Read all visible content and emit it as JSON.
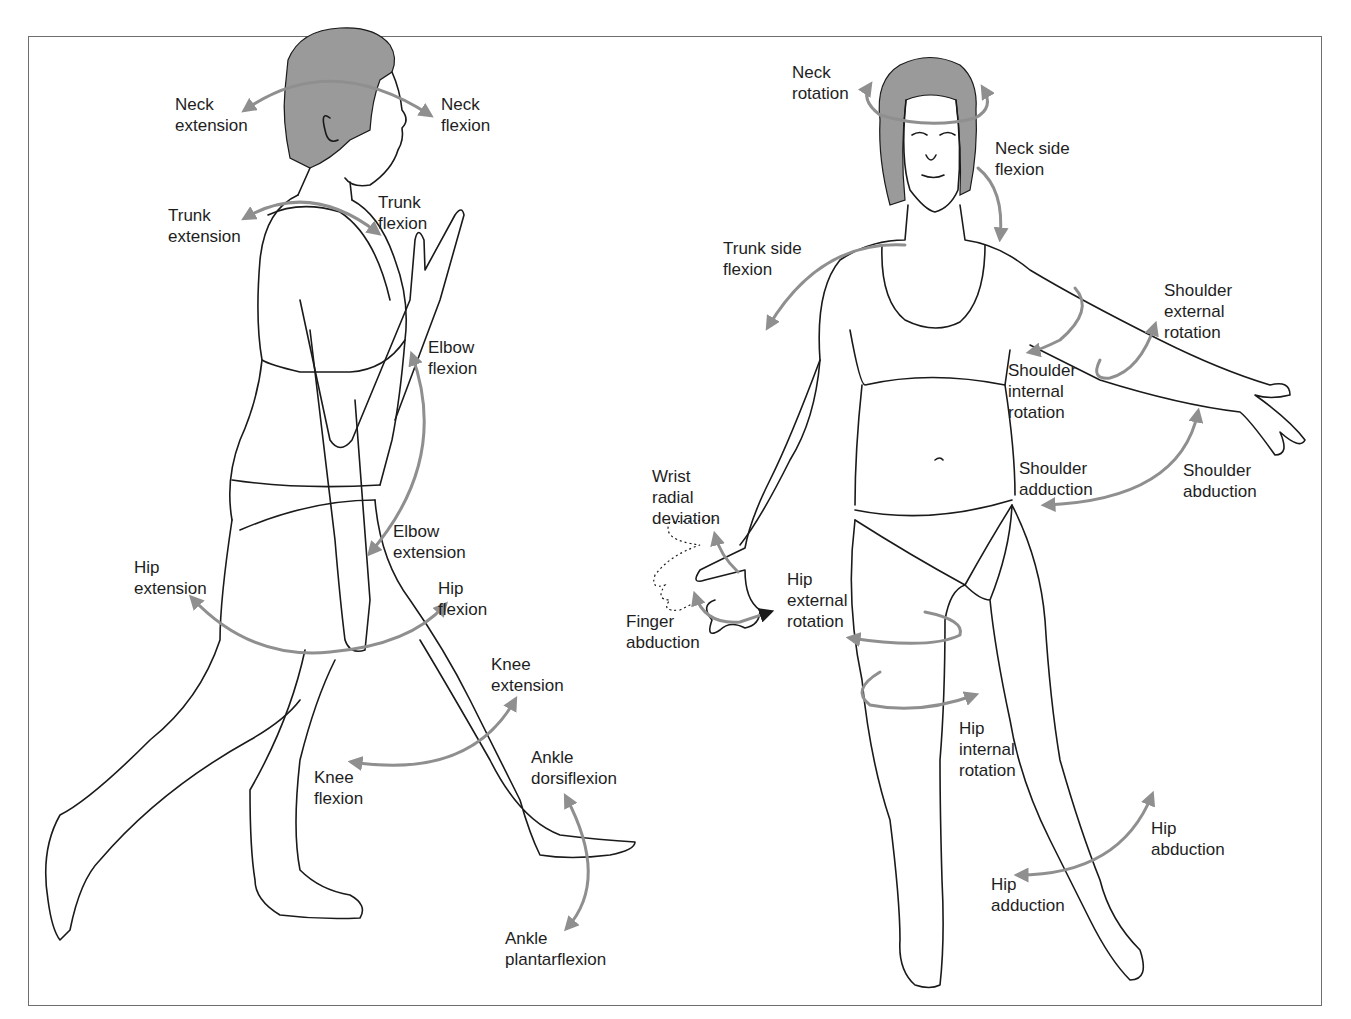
{
  "figure": {
    "arrow_color": "#8f8f8f",
    "line_color": "#1a1a1a",
    "hair_color": "#9a9a9a",
    "frame_color": "#6e6e6e"
  },
  "side_view": {
    "labels": [
      {
        "id": "neck_extension",
        "line1": "Neck",
        "line2": "extension",
        "x": 175,
        "y": 94
      },
      {
        "id": "neck_flexion",
        "line1": "Neck",
        "line2": "flexion",
        "x": 441,
        "y": 94
      },
      {
        "id": "trunk_extension",
        "line1": "Trunk",
        "line2": "extension",
        "x": 168,
        "y": 205
      },
      {
        "id": "trunk_flexion",
        "line1": "Trunk",
        "line2": "flexion",
        "x": 378,
        "y": 192
      },
      {
        "id": "elbow_flexion",
        "line1": "Elbow",
        "line2": "flexion",
        "x": 428,
        "y": 337
      },
      {
        "id": "elbow_extension",
        "line1": "Elbow",
        "line2": "extension",
        "x": 393,
        "y": 521
      },
      {
        "id": "hip_extension",
        "line1": "Hip",
        "line2": "extension",
        "x": 134,
        "y": 557
      },
      {
        "id": "hip_flexion",
        "line1": "Hip",
        "line2": "flexion",
        "x": 438,
        "y": 578
      },
      {
        "id": "knee_extension",
        "line1": "Knee",
        "line2": "extension",
        "x": 491,
        "y": 654
      },
      {
        "id": "knee_flexion",
        "line1": "Knee",
        "line2": "flexion",
        "x": 314,
        "y": 767
      },
      {
        "id": "ankle_dorsiflexion",
        "line1": "Ankle",
        "line2": "dorsiflexion",
        "x": 531,
        "y": 747
      },
      {
        "id": "ankle_plantarflexion",
        "line1": "Ankle",
        "line2": "plantarflexion",
        "x": 505,
        "y": 928
      }
    ]
  },
  "front_view": {
    "labels": [
      {
        "id": "neck_rotation",
        "line1": "Neck",
        "line2": "rotation",
        "x": 792,
        "y": 62
      },
      {
        "id": "neck_side_flexion",
        "line1": "Neck side",
        "line2": "flexion",
        "x": 995,
        "y": 138
      },
      {
        "id": "trunk_side_flexion",
        "line1": "Trunk side",
        "line2": "flexion",
        "x": 723,
        "y": 238
      },
      {
        "id": "shoulder_external_rotation",
        "line1": "Shoulder",
        "line2": "external",
        "line3": "rotation",
        "x": 1164,
        "y": 280
      },
      {
        "id": "shoulder_internal_rotation",
        "line1": "Shoulder",
        "line2": "internal",
        "line3": "rotation",
        "x": 1008,
        "y": 360
      },
      {
        "id": "shoulder_adduction",
        "line1": "Shoulder",
        "line2": "adduction",
        "x": 1019,
        "y": 458
      },
      {
        "id": "shoulder_abduction",
        "line1": "Shoulder",
        "line2": "abduction",
        "x": 1183,
        "y": 460
      },
      {
        "id": "wrist_radial_deviation",
        "line1": "Wrist",
        "line2": "radial",
        "line3": "deviation",
        "x": 652,
        "y": 466
      },
      {
        "id": "finger_abduction",
        "line1": "Finger",
        "line2": "abduction",
        "x": 626,
        "y": 611
      },
      {
        "id": "hip_external_rotation",
        "line1": "Hip",
        "line2": "external",
        "line3": "rotation",
        "x": 787,
        "y": 569
      },
      {
        "id": "hip_internal_rotation",
        "line1": "Hip",
        "line2": "internal",
        "line3": "rotation",
        "x": 959,
        "y": 718
      },
      {
        "id": "hip_abduction",
        "line1": "Hip",
        "line2": "abduction",
        "x": 1151,
        "y": 818
      },
      {
        "id": "hip_adduction",
        "line1": "Hip",
        "line2": "adduction",
        "x": 991,
        "y": 874
      }
    ]
  }
}
